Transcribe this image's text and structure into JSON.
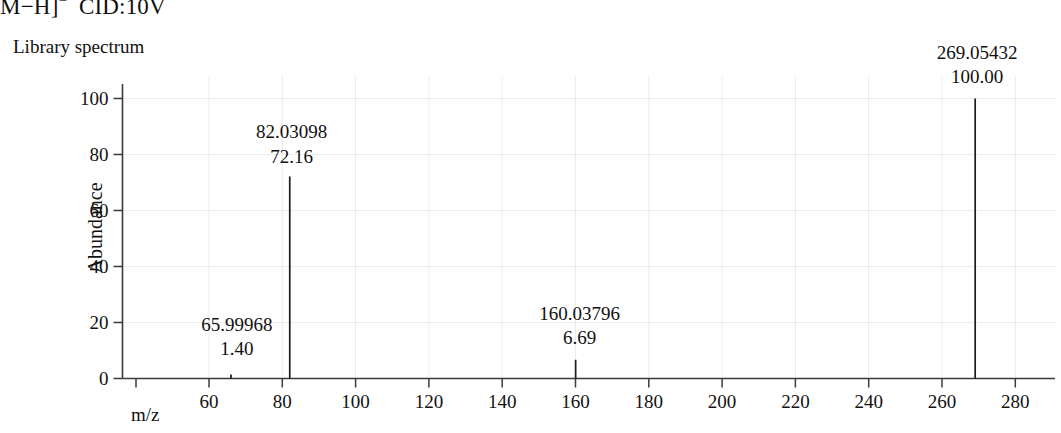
{
  "figure": {
    "title": "M−H]",
    "title_superscript": "−",
    "title_suffix": "CID:10V",
    "panel_label": "Library spectrum"
  },
  "axes": {
    "y_title": "Abundance",
    "x_title": "m/z"
  },
  "chart_data": {
    "type": "bar",
    "subtitle": "Library spectrum",
    "xlabel": "m/z",
    "ylabel": "Abundance",
    "xlim": [
      53,
      290
    ],
    "ylim": [
      0,
      107
    ],
    "grid": true,
    "legend": "none",
    "x_ticks": [
      60,
      80,
      100,
      120,
      140,
      160,
      180,
      200,
      220,
      240,
      260,
      280
    ],
    "x_tick_labels": [
      "60",
      "80",
      "100",
      "120",
      "140",
      "160",
      "180",
      "200",
      "220",
      "240",
      "260",
      "280"
    ],
    "y_ticks": [
      0,
      20,
      40,
      60,
      80,
      100
    ],
    "y_tick_labels": [
      "0",
      "20",
      "40",
      "60",
      "80",
      "100"
    ],
    "x": [
      65.99968,
      82.03098,
      160.03796,
      269.05432
    ],
    "values": [
      1.4,
      72.16,
      6.69,
      100.0
    ],
    "peaks": [
      {
        "mz": "65.99968",
        "abundance": "1.40",
        "mz_value": 65.99968,
        "abundance_value": 1.4
      },
      {
        "mz": "82.03098",
        "abundance": "72.16",
        "mz_value": 82.03098,
        "abundance_value": 72.16
      },
      {
        "mz": "160.03796",
        "abundance": "6.69",
        "mz_value": 160.03796,
        "abundance_value": 6.69
      },
      {
        "mz": "269.05432",
        "abundance": "100.00",
        "mz_value": 269.05432,
        "abundance_value": 100.0
      }
    ],
    "colors": {
      "axis": "#3b3b3b",
      "peak": "#1b1b1b",
      "grid": "#ececec",
      "text": "#121111",
      "background": "#ffffff"
    }
  }
}
